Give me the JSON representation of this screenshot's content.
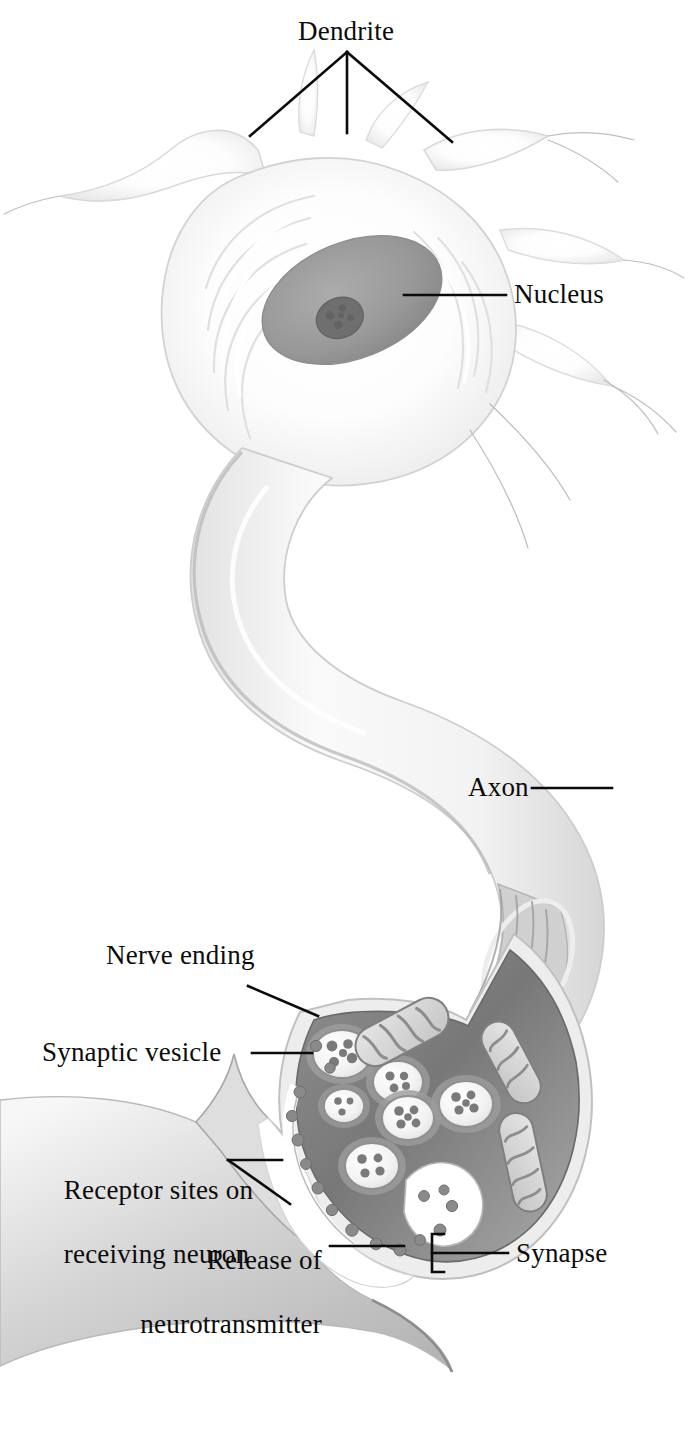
{
  "figure": {
    "kind": "anatomical-illustration",
    "subject": "neuron",
    "style": "grayscale pencil / airbrush textbook illustration",
    "background_color": "#ffffff",
    "width": 688,
    "height": 1429
  },
  "labels": {
    "dendrite": "Dendrite",
    "nucleus": "Nucleus",
    "axon": "Axon",
    "nerve_ending": "Nerve ending",
    "synaptic_vesicle": "Synaptic vesicle",
    "receptor_sites_line1": "Receptor sites on",
    "receptor_sites_line2": "receiving neuron",
    "release_line1": "Release of",
    "release_line2": "neurotransmitter",
    "synapse": "Synapse"
  },
  "colors": {
    "ink": "#0b0b0b",
    "soma_fill": "#fbfbfb",
    "soma_edge": "#d8d8d8",
    "nucleus_fill": "#9a9a9a",
    "nucleolus_fill": "#6d6d6d",
    "axon_fill": "#f4f4f4",
    "axon_edge": "#c9c9c9",
    "terminal_dark": "#6f6f6f",
    "terminal_mid": "#8d8d8d",
    "vesicle_fill": "#f2f2f2",
    "vesicle_rim": "#8a8a8a",
    "granule": "#7b7b7b",
    "mito_fill": "#d9d9d9",
    "mito_edge": "#7f7f7f",
    "cleft_white": "#ffffff",
    "receiving_neuron": "#c3c3c3"
  },
  "structures": [
    {
      "name": "dendrite",
      "description": "multiple pale branching processes radiating from the top of the cell body"
    },
    {
      "name": "cell-body",
      "description": "soma with concentric endoplasmic-reticulum striations"
    },
    {
      "name": "nucleus",
      "description": "tilted gray ellipse containing a darker nucleolus"
    },
    {
      "name": "axon",
      "description": "long S-curved pale tube descending to the nerve ending, cut away near terminal to show longitudinal fibers"
    },
    {
      "name": "nerve-ending",
      "description": "dark bulbous axon terminal filled with synaptic vesicles and mitochondria"
    },
    {
      "name": "synaptic-vesicle",
      "description": "round pale vesicles with dark rims containing neurotransmitter granules"
    },
    {
      "name": "mitochondrion",
      "description": "elongated organelles with internal cristae folds"
    },
    {
      "name": "synaptic-cleft",
      "description": "white gap between nerve ending and receiving neuron"
    },
    {
      "name": "neurotransmitter",
      "description": "small dark granules released into the synaptic cleft"
    },
    {
      "name": "receiving-neuron",
      "description": "gray membrane surface of the postsynaptic neuron at lower left"
    }
  ],
  "leaders": {
    "dendrite": "three-pronged fork descending from the label to three dendrites",
    "nucleus": "horizontal line left to the nucleus",
    "axon": "horizontal line right to the axon shaft",
    "nerve_ending": "diagonal line down-right to the terminal membrane",
    "synaptic_vesicle": "horizontal line right to a vesicle",
    "receptor_sites": "forked line: horizontal plus diagonal to the receiving membrane",
    "release_of_neurotransmitter": "horizontal line right to granules in the cleft",
    "synapse": "square bracket spanning the cleft plus horizontal line to the label"
  }
}
